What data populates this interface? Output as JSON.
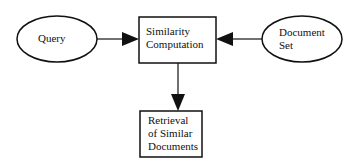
{
  "diagram": {
    "nodes": {
      "query": {
        "label": "Query",
        "shape": "ellipse"
      },
      "similarity": {
        "line1": "Similarity",
        "line2": "Computation",
        "shape": "rect"
      },
      "document_set": {
        "line1": "Document",
        "line2": "Set",
        "shape": "ellipse"
      },
      "retrieval": {
        "line1": "Retrieval",
        "line2": "of Similar",
        "line3": "Documents",
        "shape": "rect"
      }
    },
    "edges": [
      {
        "from": "query",
        "to": "similarity"
      },
      {
        "from": "document_set",
        "to": "similarity"
      },
      {
        "from": "similarity",
        "to": "retrieval"
      }
    ]
  }
}
